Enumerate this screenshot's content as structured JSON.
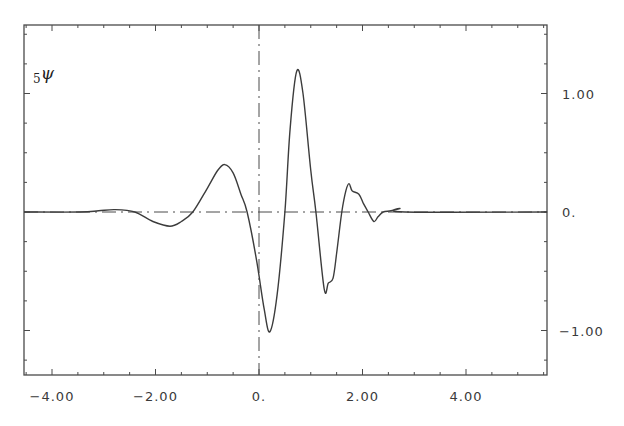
{
  "chart_data": {
    "type": "line",
    "title": "",
    "curve_label": {
      "subscript": "5",
      "symbol": "ψ"
    },
    "xlabel": "",
    "ylabel": "",
    "xlim": [
      -4.54,
      5.57
    ],
    "ylim": [
      -1.37,
      1.58
    ],
    "x_ticks": [
      -4.0,
      -2.0,
      0.0,
      2.0,
      4.0
    ],
    "x_tick_labels": [
      "-4.00",
      "-2.00",
      "0.",
      "2.00",
      "4.00"
    ],
    "y_ticks": [
      1.0,
      0.0,
      -1.0
    ],
    "y_tick_labels": [
      "1.00",
      "0.",
      "-1.00"
    ],
    "y_axis_side": "right",
    "grid": false,
    "reference_lines": [
      {
        "orientation": "horizontal",
        "value": 0,
        "style": "dash-dot"
      },
      {
        "orientation": "vertical",
        "value": 0,
        "style": "dash-dot"
      }
    ],
    "series": [
      {
        "name": "5ψ",
        "x": [
          -4.54,
          -3.46,
          -3.1,
          -2.78,
          -2.4,
          -2.05,
          -1.72,
          -1.5,
          -1.28,
          -1.0,
          -0.8,
          -0.66,
          -0.5,
          -0.35,
          -0.23,
          -0.05,
          0.1,
          0.21,
          0.35,
          0.5,
          0.6,
          0.73,
          0.85,
          1.0,
          1.1,
          1.26,
          1.34,
          1.43,
          1.5,
          1.6,
          1.68,
          1.74,
          1.8,
          1.93,
          2.02,
          2.11,
          2.22,
          2.3,
          2.4,
          2.55,
          2.72,
          2.82,
          5.57
        ],
        "y": [
          0.0,
          0.0,
          0.01,
          0.02,
          0.0,
          -0.08,
          -0.12,
          -0.08,
          0.0,
          0.2,
          0.35,
          0.4,
          0.33,
          0.15,
          0.0,
          -0.4,
          -0.82,
          -1.01,
          -0.7,
          0.0,
          0.7,
          1.19,
          1.0,
          0.35,
          0.0,
          -0.65,
          -0.6,
          -0.56,
          -0.35,
          0.0,
          0.18,
          0.24,
          0.18,
          0.15,
          0.07,
          0.0,
          -0.08,
          -0.04,
          0.0,
          0.01,
          0.03,
          0.0,
          0.0
        ]
      }
    ]
  },
  "plot_area": {
    "left": 24,
    "top": 25,
    "right": 547,
    "bottom": 375
  },
  "colors": {
    "line": "#3c3c3c",
    "axis": "#4a4a4a",
    "background": "#ffffff"
  }
}
